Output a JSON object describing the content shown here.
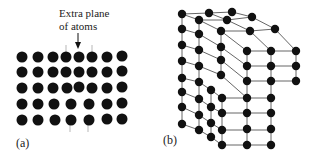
{
  "figure": {
    "panel_a": {
      "label": "(a)",
      "annotation_line1": "Extra plane",
      "annotation_line2": "of atoms",
      "description": "Edge dislocation cross-section: square lattice of atoms with an extra half-plane inserted from the top"
    },
    "panel_b": {
      "label": "(b)",
      "description": "3D ball-and-stick lattice showing edge dislocation with extra half-plane of atoms"
    },
    "colors": {
      "atom": "#111111",
      "bond": "#555555",
      "text": "#222222",
      "background": "#ffffff"
    }
  }
}
